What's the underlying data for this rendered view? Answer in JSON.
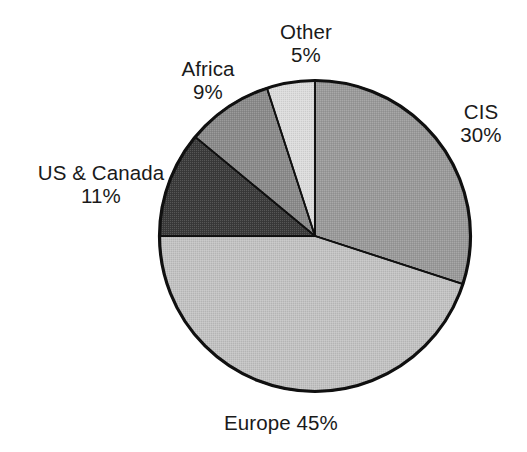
{
  "chart_data": {
    "type": "pie",
    "title": "",
    "subtitle": "",
    "xlabel": "",
    "ylabel": "",
    "legend_position": "none",
    "grid": false,
    "start_angle_deg": 0,
    "direction": "clockwise",
    "units": "percent",
    "categories": [
      "CIS",
      "Europe",
      "US & Canada",
      "Africa",
      "Other"
    ],
    "values": [
      30,
      45,
      11,
      9,
      5
    ],
    "slices": [
      {
        "label": "CIS",
        "value": 30,
        "value_text": "30%",
        "color": "#9a9a9a",
        "start_deg": 0,
        "end_deg": 108
      },
      {
        "label": "Europe",
        "value": 45,
        "value_text": "45%",
        "color": "#c2c2c2",
        "start_deg": 108,
        "end_deg": 270
      },
      {
        "label": "US & Canada",
        "value": 11,
        "value_text": "11%",
        "color": "#3a3a3a",
        "start_deg": 270,
        "end_deg": 309.6
      },
      {
        "label": "Africa",
        "value": 9,
        "value_text": "9%",
        "color": "#8a8a8a",
        "start_deg": 309.6,
        "end_deg": 342
      },
      {
        "label": "Other",
        "value": 5,
        "value_text": "5%",
        "color": "#dcdcdc",
        "start_deg": 342,
        "end_deg": 360
      }
    ],
    "outline_color": "#101010",
    "background_color": "#ffffff",
    "text_color": "#1a1a1a"
  },
  "labels": {
    "other": {
      "name": "Other",
      "value": "5%"
    },
    "africa": {
      "name": "Africa",
      "value": "9%"
    },
    "us_canada": {
      "name": "US & Canada",
      "value": "11%"
    },
    "cis": {
      "name": "CIS",
      "value": "30%"
    },
    "europe": {
      "name": "Europe",
      "value": "45%"
    }
  }
}
